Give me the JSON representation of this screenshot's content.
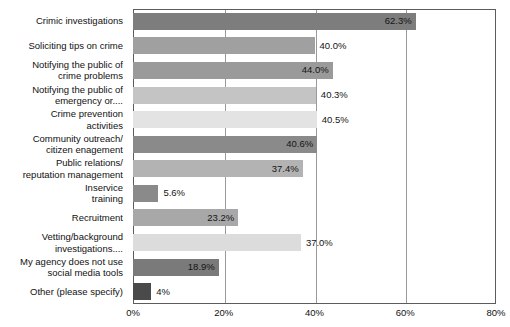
{
  "chart_data": {
    "type": "bar",
    "orientation": "horizontal",
    "title": "",
    "subtitle": "",
    "xlabel": "",
    "ylabel": "",
    "xlim": [
      0,
      80
    ],
    "grid": true,
    "legend": "none",
    "xticks": [
      "0%",
      "20%",
      "40%",
      "60%",
      "80%"
    ],
    "xtick_values": [
      0,
      20,
      40,
      60,
      80
    ],
    "categories": [
      "Crimic investigations",
      "Soliciting tips on crime",
      "Notifying the public of\ncrime problems",
      "Notifying the public of\nemergency or....",
      "Crime prevention\nactivities",
      "Community outreach/\ncitizen enagement",
      "Public relations/\nreputation management",
      "Inservice\ntraining",
      "Recruitment",
      "Vetting/background\ninvestigations....",
      "My agency does not use\nsocial media tools",
      "Other (please specify)"
    ],
    "values": [
      62.3,
      40.0,
      44.0,
      40.3,
      40.5,
      40.6,
      37.4,
      5.6,
      23.2,
      37.0,
      18.9,
      4.0
    ],
    "value_labels": [
      "62.3%",
      "40.0%",
      "44.0%",
      "40.3%",
      "40.5%",
      "40.6%",
      "37.4%",
      "5.6%",
      "23.2%",
      "37.0%",
      "18.9%",
      "4%"
    ],
    "label_placement": [
      "inside",
      "outside",
      "inside",
      "outside",
      "outside",
      "inside",
      "inside",
      "outside",
      "inside",
      "outside",
      "inside",
      "outside"
    ],
    "bar_colors": [
      "#7d7d7d",
      "#a0a0a0",
      "#9a9a9a",
      "#c4c4c4",
      "#e3e3e3",
      "#8a8a8a",
      "#b3b3b3",
      "#8a8a8a",
      "#a8a8a8",
      "#dcdcdc",
      "#7a7a7a",
      "#4a4a4a"
    ],
    "axis_color": "#5c5c5c",
    "gridline_color": "#9a9a9a",
    "background_color": "#ffffff"
  }
}
